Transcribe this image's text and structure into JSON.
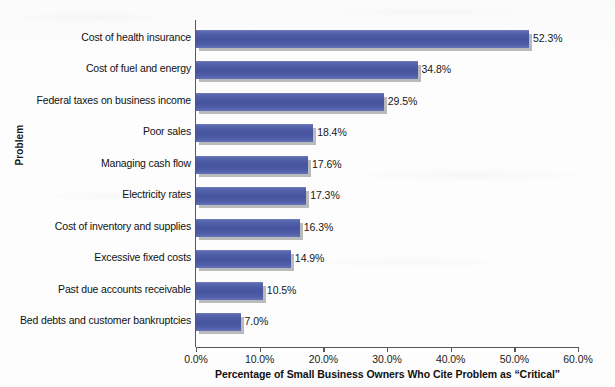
{
  "chart_data": {
    "type": "bar",
    "orientation": "horizontal",
    "title": "",
    "xlabel": "Percentage of Small Business Owners Who Cite Problem as “Critical”",
    "ylabel": "Problem",
    "xlim": [
      0,
      60
    ],
    "xtick_labels": [
      "0.0%",
      "10.0%",
      "20.0%",
      "30.0%",
      "40.0%",
      "50.0%",
      "60.0%"
    ],
    "xticks": [
      0,
      10,
      20,
      30,
      40,
      50,
      60
    ],
    "grid": false,
    "legend": "none",
    "bar_color": "#4e5da6",
    "shadow_color": "#b9babb",
    "categories": [
      "Cost of health insurance",
      "Cost of fuel and energy",
      "Federal taxes on business income",
      "Poor sales",
      "Managing cash flow",
      "Electricity rates",
      "Cost of inventory and supplies",
      "Excessive fixed costs",
      "Past due accounts receivable",
      "Bed debts and customer bankruptcies"
    ],
    "values": [
      52.3,
      34.8,
      29.5,
      18.4,
      17.6,
      17.3,
      16.3,
      14.9,
      10.5,
      7.0
    ],
    "value_labels": [
      "52.3%",
      "34.8%",
      "29.5%",
      "18.4%",
      "17.6%",
      "17.3%",
      "16.3%",
      "14.9%",
      "10.5%",
      "7.0%"
    ]
  }
}
